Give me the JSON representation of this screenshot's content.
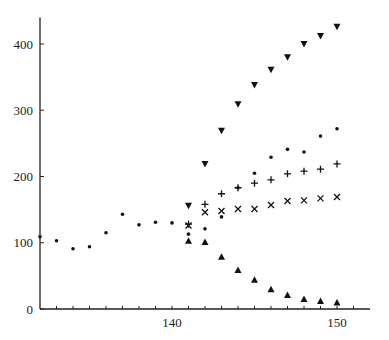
{
  "chart_data": {
    "type": "scatter",
    "title": "",
    "xlabel": "",
    "ylabel": "",
    "xlim": [
      131.9,
      152
    ],
    "ylim": [
      0,
      440
    ],
    "grid": false,
    "legend": null,
    "x_ticks_labeled": [
      140,
      150
    ],
    "x_ticks_minor": [
      133,
      134,
      135,
      136,
      137,
      138,
      139,
      140,
      141,
      142,
      143,
      144,
      145,
      146,
      147,
      148,
      149,
      150,
      151
    ],
    "y_ticks": [
      0,
      100,
      200,
      300,
      400
    ],
    "series": [
      {
        "name": "dots",
        "marker": "dot",
        "x": [
          132,
          133,
          134,
          135,
          136,
          137,
          138,
          139,
          140,
          141,
          142,
          143,
          144,
          145,
          146,
          147,
          148,
          149,
          150
        ],
        "y": [
          109,
          103,
          91,
          94,
          115,
          143,
          127,
          131,
          130,
          113,
          121,
          139,
          183,
          205,
          229,
          241,
          237,
          261,
          272
        ]
      },
      {
        "name": "plus",
        "marker": "plus",
        "x": [
          141,
          142,
          143,
          144,
          145,
          146,
          147,
          148,
          149,
          150
        ],
        "y": [
          128,
          158,
          174,
          183,
          190,
          195,
          204,
          208,
          211,
          219
        ]
      },
      {
        "name": "cross",
        "marker": "cross",
        "x": [
          141,
          142,
          143,
          144,
          145,
          146,
          147,
          148,
          149,
          150
        ],
        "y": [
          126,
          146,
          148,
          151,
          151,
          157,
          163,
          164,
          167,
          169
        ]
      },
      {
        "name": "down-triangles",
        "marker": "triangle-down",
        "x": [
          141,
          142,
          143,
          144,
          145,
          146,
          147,
          148,
          149,
          150
        ],
        "y": [
          156,
          219,
          269,
          309,
          338,
          361,
          380,
          400,
          412,
          426
        ]
      },
      {
        "name": "up-triangles",
        "marker": "triangle-up",
        "x": [
          141,
          142,
          143,
          144,
          145,
          146,
          147,
          148,
          149,
          150
        ],
        "y": [
          103,
          101,
          79,
          59,
          44,
          30,
          21,
          15,
          12,
          10
        ]
      }
    ]
  },
  "colors": {
    "axis": "#222222",
    "marker": "#111111",
    "background": "#ffffff"
  }
}
